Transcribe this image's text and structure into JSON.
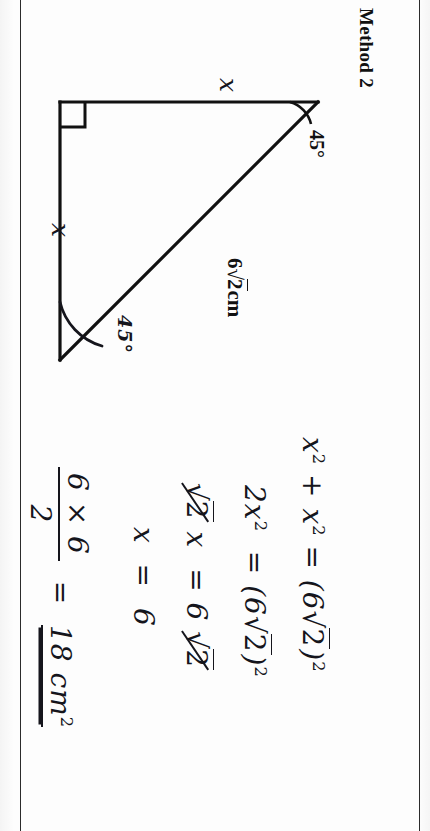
{
  "document": {
    "title": "Method 2",
    "type": "handwritten-math-worksheet",
    "orientation": "rotated-90-clockwise"
  },
  "figure": {
    "name": "right-isosceles-triangle",
    "right_angle_marker": true,
    "labels": {
      "leg_top": "x",
      "leg_left": "x",
      "hypotenuse_prefix": "6",
      "hypotenuse_radical": "√",
      "hypotenuse_radicand": "2",
      "hypotenuse_unit": "cm",
      "hypotenuse_full": "6√2cm",
      "angle_right_vertex": "45°",
      "angle_bottom_vertex": "45°"
    },
    "stroke_color": "#111111"
  },
  "working": {
    "line1": {
      "base": "x",
      "exp": "2",
      "plus": "+",
      "term2": "x",
      "term2_exp": "2",
      "equals": "=",
      "rhs_open": "(",
      "rhs_coef": "6",
      "rhs_radical": "√",
      "rhs_radicand": "2",
      "rhs_close": ")",
      "rhs_exp": "2",
      "text": "x² + x² = (6√2)²"
    },
    "line2": {
      "coef": "2",
      "base": "x",
      "exp": "2",
      "equals": "=",
      "rhs_open": "(",
      "rhs_coef": "6",
      "rhs_radical": "√",
      "rhs_radicand": "2",
      "rhs_close": ")",
      "rhs_exp": "2",
      "text": "2x² = (6√2)²"
    },
    "line3": {
      "radical": "√",
      "radicand": "2",
      "cancelled_left": true,
      "base": "x",
      "equals": "=",
      "rhs_coef": "6",
      "rhs_radical": "√",
      "rhs_radicand": "2",
      "cancelled_right": true,
      "text": "√2 x = 6√2"
    },
    "line4": {
      "base": "x",
      "equals": "=",
      "value": "6",
      "text": "x = 6"
    },
    "line5": {
      "numerator": "6 × 6",
      "denominator": "2",
      "equals": "=",
      "result": "18",
      "unit": "cm",
      "unit_exp": "2",
      "double_underlined": true,
      "text": "6 × 6 / 2 = 18 cm²"
    }
  },
  "colors": {
    "ink": "#15151c",
    "print": "#111111",
    "paper": "#fdfdfd",
    "border": "#2b2b2b"
  }
}
